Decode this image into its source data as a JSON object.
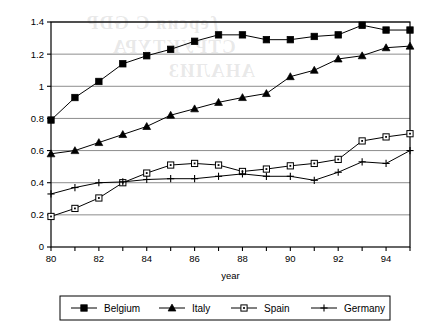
{
  "chart_data": {
    "type": "line",
    "title": "",
    "xlabel": "year",
    "ylabel": "",
    "x": [
      80,
      81,
      82,
      83,
      84,
      85,
      86,
      87,
      88,
      89,
      90,
      91,
      92,
      93,
      94,
      95
    ],
    "x_tick_labels": [
      "80",
      "",
      "82",
      "",
      "84",
      "",
      "86",
      "",
      "88",
      "",
      "90",
      "",
      "92",
      "",
      "94",
      ""
    ],
    "y_tick_labels": [
      "0",
      "0.2",
      "0.4",
      "0.6",
      "0.8",
      "1",
      "1.2",
      "1.4"
    ],
    "y_ticks": [
      0,
      0.2,
      0.4,
      0.6,
      0.8,
      1.0,
      1.2,
      1.4
    ],
    "xlim": [
      80,
      95
    ],
    "ylim": [
      0,
      1.4
    ],
    "grid": "horizontal",
    "legend_position": "bottom",
    "series": [
      {
        "name": "Belgium",
        "marker": "filled-square",
        "color": "#000000",
        "values": [
          0.79,
          0.93,
          1.03,
          1.14,
          1.19,
          1.23,
          1.28,
          1.32,
          1.32,
          1.29,
          1.29,
          1.31,
          1.32,
          1.38,
          1.35,
          1.35
        ]
      },
      {
        "name": "Italy",
        "marker": "filled-triangle",
        "color": "#000000",
        "values": [
          0.58,
          0.6,
          0.65,
          0.7,
          0.75,
          0.82,
          0.86,
          0.9,
          0.93,
          0.955,
          1.06,
          1.1,
          1.17,
          1.19,
          1.24,
          1.25
        ]
      },
      {
        "name": "Spain",
        "marker": "open-square-dot",
        "color": "#000000",
        "values": [
          0.19,
          0.24,
          0.305,
          0.4,
          0.46,
          0.51,
          0.52,
          0.51,
          0.47,
          0.485,
          0.505,
          0.52,
          0.545,
          0.66,
          0.685,
          0.705
        ]
      },
      {
        "name": "Germany",
        "marker": "plus",
        "color": "#000000",
        "values": [
          0.33,
          0.37,
          0.4,
          0.405,
          0.42,
          0.425,
          0.425,
          0.44,
          0.455,
          0.44,
          0.44,
          0.415,
          0.465,
          0.53,
          0.52,
          0.6
        ]
      }
    ]
  },
  "axis": {
    "x_title": "year"
  },
  "legend": {
    "entries": [
      {
        "label": "Belgium",
        "marker": "filled-square"
      },
      {
        "label": "Italy",
        "marker": "filled-triangle"
      },
      {
        "label": "Spain",
        "marker": "open-square-dot"
      },
      {
        "label": "Germany",
        "marker": "plus"
      }
    ]
  },
  "watermark": {
    "line1": "ƒерсия C GDP",
    "line2": "СТРУКТУРА",
    "line3": "АНАЛИЗ"
  },
  "colors": {
    "plot_border": "#000000",
    "gridline": "#808080",
    "series": "#000000",
    "background": "#ffffff"
  }
}
